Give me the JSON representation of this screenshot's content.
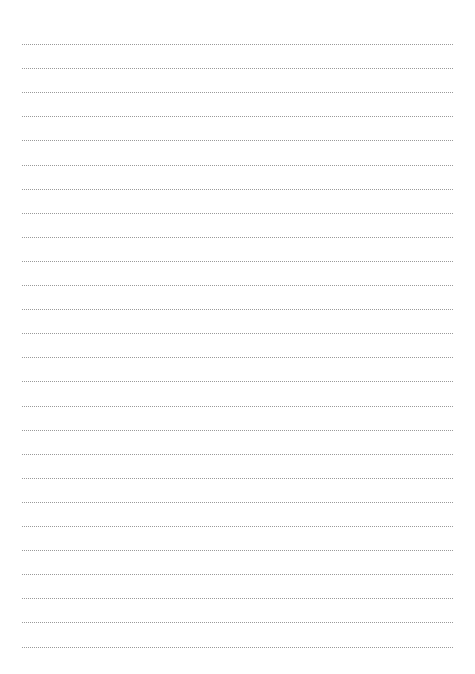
{
  "page": {
    "type": "lined-paper",
    "line_count": 26,
    "first_line_y": 44,
    "line_spacing": 24.1,
    "line_left": 22,
    "line_width": 431,
    "line_style": "dotted",
    "line_color": "#9a9a9a",
    "background_color": "#ffffff"
  }
}
